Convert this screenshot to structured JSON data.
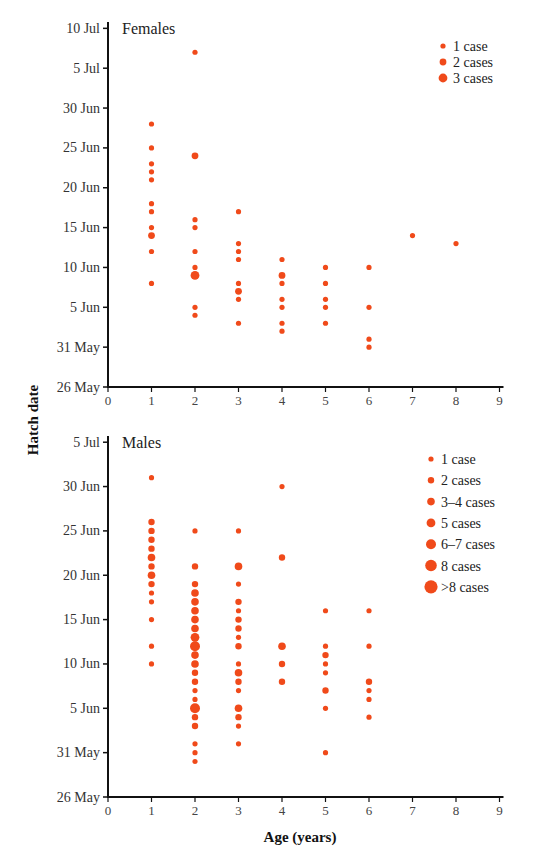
{
  "chart_data": [
    {
      "type": "scatter",
      "title": "Females",
      "xlabel": "Age (years)",
      "ylabel": "Hatch date",
      "xlim": [
        0,
        9
      ],
      "x_ticks": [
        "0",
        "1",
        "2",
        "3",
        "4",
        "5",
        "6",
        "7",
        "8",
        "9"
      ],
      "y_ticks": [
        "26 May",
        "31 May",
        "5 Jun",
        "10 Jun",
        "15 Jun",
        "20 Jun",
        "25 Jun",
        "30 Jun",
        "5 Jul",
        "10 Jul"
      ],
      "y_unit": "days since 26 May",
      "ylim": [
        0,
        45
      ],
      "legend": [
        {
          "label": "1 case",
          "size": 1
        },
        {
          "label": "2 cases",
          "size": 2
        },
        {
          "label": "3 cases",
          "size": 3
        }
      ],
      "points": [
        {
          "age": 1,
          "day": 33,
          "date": "28 Jun",
          "count": 1
        },
        {
          "age": 1,
          "day": 30,
          "date": "25 Jun",
          "count": 1
        },
        {
          "age": 1,
          "day": 28,
          "date": "23 Jun",
          "count": 1
        },
        {
          "age": 1,
          "day": 27,
          "date": "22 Jun",
          "count": 1
        },
        {
          "age": 1,
          "day": 26,
          "date": "21 Jun",
          "count": 1
        },
        {
          "age": 1,
          "day": 23,
          "date": "18 Jun",
          "count": 1
        },
        {
          "age": 1,
          "day": 22,
          "date": "17 Jun",
          "count": 1
        },
        {
          "age": 1,
          "day": 20,
          "date": "15 Jun",
          "count": 1
        },
        {
          "age": 1,
          "day": 19,
          "date": "14 Jun",
          "count": 2
        },
        {
          "age": 1,
          "day": 17,
          "date": "12 Jun",
          "count": 1
        },
        {
          "age": 1,
          "day": 13,
          "date": "8 Jun",
          "count": 1
        },
        {
          "age": 2,
          "day": 42,
          "date": "7 Jul",
          "count": 1
        },
        {
          "age": 2,
          "day": 29,
          "date": "24 Jun",
          "count": 2
        },
        {
          "age": 2,
          "day": 21,
          "date": "16 Jun",
          "count": 1
        },
        {
          "age": 2,
          "day": 20,
          "date": "15 Jun",
          "count": 1
        },
        {
          "age": 2,
          "day": 17,
          "date": "12 Jun",
          "count": 1
        },
        {
          "age": 2,
          "day": 15,
          "date": "10 Jun",
          "count": 1
        },
        {
          "age": 2,
          "day": 14,
          "date": "9 Jun",
          "count": 3
        },
        {
          "age": 2,
          "day": 10,
          "date": "5 Jun",
          "count": 1
        },
        {
          "age": 2,
          "day": 9,
          "date": "4 Jun",
          "count": 1
        },
        {
          "age": 3,
          "day": 22,
          "date": "17 Jun",
          "count": 1
        },
        {
          "age": 3,
          "day": 18,
          "date": "13 Jun",
          "count": 1
        },
        {
          "age": 3,
          "day": 17,
          "date": "12 Jun",
          "count": 1
        },
        {
          "age": 3,
          "day": 16,
          "date": "11 Jun",
          "count": 1
        },
        {
          "age": 3,
          "day": 13,
          "date": "8 Jun",
          "count": 1
        },
        {
          "age": 3,
          "day": 12,
          "date": "7 Jun",
          "count": 2
        },
        {
          "age": 3,
          "day": 11,
          "date": "6 Jun",
          "count": 1
        },
        {
          "age": 3,
          "day": 8,
          "date": "3 Jun",
          "count": 1
        },
        {
          "age": 4,
          "day": 16,
          "date": "11 Jun",
          "count": 1
        },
        {
          "age": 4,
          "day": 14,
          "date": "9 Jun",
          "count": 2
        },
        {
          "age": 4,
          "day": 13,
          "date": "8 Jun",
          "count": 1
        },
        {
          "age": 4,
          "day": 11,
          "date": "6 Jun",
          "count": 1
        },
        {
          "age": 4,
          "day": 10,
          "date": "5 Jun",
          "count": 1
        },
        {
          "age": 4,
          "day": 8,
          "date": "3 Jun",
          "count": 1
        },
        {
          "age": 4,
          "day": 7,
          "date": "2 Jun",
          "count": 1
        },
        {
          "age": 5,
          "day": 15,
          "date": "10 Jun",
          "count": 1
        },
        {
          "age": 5,
          "day": 13,
          "date": "8 Jun",
          "count": 1
        },
        {
          "age": 5,
          "day": 11,
          "date": "6 Jun",
          "count": 1
        },
        {
          "age": 5,
          "day": 10,
          "date": "5 Jun",
          "count": 1
        },
        {
          "age": 5,
          "day": 8,
          "date": "3 Jun",
          "count": 1
        },
        {
          "age": 6,
          "day": 15,
          "date": "10 Jun",
          "count": 1
        },
        {
          "age": 6,
          "day": 10,
          "date": "5 Jun",
          "count": 1
        },
        {
          "age": 6,
          "day": 6,
          "date": "1 Jun",
          "count": 1
        },
        {
          "age": 6,
          "day": 5,
          "date": "31 May",
          "count": 1
        },
        {
          "age": 7,
          "day": 19,
          "date": "14 Jun",
          "count": 1
        },
        {
          "age": 8,
          "day": 18,
          "date": "13 Jun",
          "count": 1
        }
      ]
    },
    {
      "type": "scatter",
      "title": "Males",
      "xlabel": "Age (years)",
      "ylabel": "Hatch date",
      "xlim": [
        0,
        9
      ],
      "x_ticks": [
        "0",
        "1",
        "2",
        "3",
        "4",
        "5",
        "6",
        "7",
        "8",
        "9"
      ],
      "y_ticks": [
        "26 May",
        "31 May",
        "5 Jun",
        "10 Jun",
        "15 Jun",
        "20 Jun",
        "25 Jun",
        "30 Jun",
        "5 Jul"
      ],
      "y_unit": "days since 26 May",
      "ylim": [
        0,
        40
      ],
      "legend": [
        {
          "label": "1 case",
          "size": 1
        },
        {
          "label": "2 cases",
          "size": 2
        },
        {
          "label": "3–4 cases",
          "size": 3
        },
        {
          "label": "5 cases",
          "size": 4
        },
        {
          "label": "6–7 cases",
          "size": 5
        },
        {
          "label": "8 cases",
          "size": 6
        },
        {
          "label": ">8 cases",
          "size": 7
        }
      ],
      "points": [
        {
          "age": 1,
          "day": 36,
          "date": "1 Jul",
          "count": 1
        },
        {
          "age": 1,
          "day": 31,
          "date": "26 Jun",
          "count": 2
        },
        {
          "age": 1,
          "day": 30,
          "date": "25 Jun",
          "count": 2
        },
        {
          "age": 1,
          "day": 29,
          "date": "24 Jun",
          "count": 2
        },
        {
          "age": 1,
          "day": 28,
          "date": "23 Jun",
          "count": 2
        },
        {
          "age": 1,
          "day": 27,
          "date": "22 Jun",
          "count": 3
        },
        {
          "age": 1,
          "day": 26,
          "date": "21 Jun",
          "count": 2
        },
        {
          "age": 1,
          "day": 25,
          "date": "20 Jun",
          "count": 3
        },
        {
          "age": 1,
          "day": 24,
          "date": "19 Jun",
          "count": 2
        },
        {
          "age": 1,
          "day": 23,
          "date": "18 Jun",
          "count": 1
        },
        {
          "age": 1,
          "day": 22,
          "date": "17 Jun",
          "count": 1
        },
        {
          "age": 1,
          "day": 20,
          "date": "15 Jun",
          "count": 1
        },
        {
          "age": 1,
          "day": 17,
          "date": "12 Jun",
          "count": 1
        },
        {
          "age": 1,
          "day": 15,
          "date": "10 Jun",
          "count": 1
        },
        {
          "age": 2,
          "day": 30,
          "date": "25 Jun",
          "count": 1
        },
        {
          "age": 2,
          "day": 26,
          "date": "21 Jun",
          "count": 2
        },
        {
          "age": 2,
          "day": 24,
          "date": "19 Jun",
          "count": 2
        },
        {
          "age": 2,
          "day": 23,
          "date": "18 Jun",
          "count": 3
        },
        {
          "age": 2,
          "day": 22,
          "date": "17 Jun",
          "count": 3
        },
        {
          "age": 2,
          "day": 21,
          "date": "16 Jun",
          "count": 4
        },
        {
          "age": 2,
          "day": 20,
          "date": "15 Jun",
          "count": 4
        },
        {
          "age": 2,
          "day": 19,
          "date": "14 Jun",
          "count": 4
        },
        {
          "age": 2,
          "day": 18,
          "date": "13 Jun",
          "count": 5
        },
        {
          "age": 2,
          "day": 17,
          "date": "12 Jun",
          "count": 7
        },
        {
          "age": 2,
          "day": 16,
          "date": "11 Jun",
          "count": 3
        },
        {
          "age": 2,
          "day": 15,
          "date": "10 Jun",
          "count": 3
        },
        {
          "age": 2,
          "day": 14,
          "date": "9 Jun",
          "count": 2
        },
        {
          "age": 2,
          "day": 13,
          "date": "8 Jun",
          "count": 2
        },
        {
          "age": 2,
          "day": 12,
          "date": "7 Jun",
          "count": 1
        },
        {
          "age": 2,
          "day": 11,
          "date": "6 Jun",
          "count": 1
        },
        {
          "age": 2,
          "day": 10,
          "date": "5 Jun",
          "count": 6
        },
        {
          "age": 2,
          "day": 9,
          "date": "4 Jun",
          "count": 2
        },
        {
          "age": 2,
          "day": 8,
          "date": "3 Jun",
          "count": 2
        },
        {
          "age": 2,
          "day": 6,
          "date": "1 Jun",
          "count": 1
        },
        {
          "age": 2,
          "day": 5,
          "date": "31 May",
          "count": 1
        },
        {
          "age": 2,
          "day": 4,
          "date": "30 May",
          "count": 1
        },
        {
          "age": 3,
          "day": 30,
          "date": "25 Jun",
          "count": 1
        },
        {
          "age": 3,
          "day": 26,
          "date": "21 Jun",
          "count": 3
        },
        {
          "age": 3,
          "day": 24,
          "date": "19 Jun",
          "count": 1
        },
        {
          "age": 3,
          "day": 22,
          "date": "17 Jun",
          "count": 2
        },
        {
          "age": 3,
          "day": 21,
          "date": "16 Jun",
          "count": 1
        },
        {
          "age": 3,
          "day": 20,
          "date": "15 Jun",
          "count": 2
        },
        {
          "age": 3,
          "day": 19,
          "date": "14 Jun",
          "count": 2
        },
        {
          "age": 3,
          "day": 18,
          "date": "13 Jun",
          "count": 1
        },
        {
          "age": 3,
          "day": 17,
          "date": "12 Jun",
          "count": 2
        },
        {
          "age": 3,
          "day": 15,
          "date": "10 Jun",
          "count": 1
        },
        {
          "age": 3,
          "day": 14,
          "date": "9 Jun",
          "count": 3
        },
        {
          "age": 3,
          "day": 13,
          "date": "8 Jun",
          "count": 2
        },
        {
          "age": 3,
          "day": 12,
          "date": "7 Jun",
          "count": 1
        },
        {
          "age": 3,
          "day": 10,
          "date": "5 Jun",
          "count": 3
        },
        {
          "age": 3,
          "day": 9,
          "date": "4 Jun",
          "count": 2
        },
        {
          "age": 3,
          "day": 8,
          "date": "3 Jun",
          "count": 1
        },
        {
          "age": 3,
          "day": 6,
          "date": "1 Jun",
          "count": 1
        },
        {
          "age": 4,
          "day": 35,
          "date": "30 Jun",
          "count": 1
        },
        {
          "age": 4,
          "day": 27,
          "date": "22 Jun",
          "count": 2
        },
        {
          "age": 4,
          "day": 17,
          "date": "12 Jun",
          "count": 3
        },
        {
          "age": 4,
          "day": 15,
          "date": "10 Jun",
          "count": 2
        },
        {
          "age": 4,
          "day": 13,
          "date": "8 Jun",
          "count": 2
        },
        {
          "age": 5,
          "day": 21,
          "date": "16 Jun",
          "count": 1
        },
        {
          "age": 5,
          "day": 17,
          "date": "12 Jun",
          "count": 1
        },
        {
          "age": 5,
          "day": 16,
          "date": "11 Jun",
          "count": 2
        },
        {
          "age": 5,
          "day": 15,
          "date": "10 Jun",
          "count": 1
        },
        {
          "age": 5,
          "day": 14,
          "date": "9 Jun",
          "count": 1
        },
        {
          "age": 5,
          "day": 12,
          "date": "7 Jun",
          "count": 2
        },
        {
          "age": 5,
          "day": 10,
          "date": "5 Jun",
          "count": 1
        },
        {
          "age": 5,
          "day": 5,
          "date": "31 May",
          "count": 1
        },
        {
          "age": 6,
          "day": 21,
          "date": "16 Jun",
          "count": 1
        },
        {
          "age": 6,
          "day": 17,
          "date": "12 Jun",
          "count": 1
        },
        {
          "age": 6,
          "day": 13,
          "date": "8 Jun",
          "count": 2
        },
        {
          "age": 6,
          "day": 12,
          "date": "7 Jun",
          "count": 1
        },
        {
          "age": 6,
          "day": 11,
          "date": "6 Jun",
          "count": 1
        },
        {
          "age": 6,
          "day": 9,
          "date": "4 Jun",
          "count": 1
        }
      ]
    }
  ],
  "labels": {
    "y_axis_title": "Hatch date",
    "x_axis_title": "Age (years)"
  },
  "colors": {
    "point": "#f04a1a",
    "axis": "#111111"
  }
}
